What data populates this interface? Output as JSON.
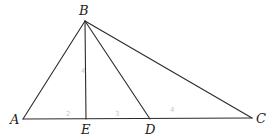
{
  "diagram": {
    "type": "geometry-triangle",
    "points": {
      "A": {
        "label": "A",
        "x": 23,
        "y": 119,
        "label_x": 10,
        "label_y": 124
      },
      "B": {
        "label": "B",
        "x": 85,
        "y": 21,
        "label_x": 79,
        "label_y": 15
      },
      "C": {
        "label": "C",
        "x": 252,
        "y": 118,
        "label_x": 256,
        "label_y": 123
      },
      "D": {
        "label": "D",
        "x": 150,
        "y": 119,
        "label_x": 145,
        "label_y": 134
      },
      "E": {
        "label": "E",
        "x": 86,
        "y": 119,
        "label_x": 81,
        "label_y": 134
      }
    },
    "segments": [
      {
        "from": "A",
        "to": "B"
      },
      {
        "from": "B",
        "to": "C"
      },
      {
        "from": "A",
        "to": "C"
      },
      {
        "from": "B",
        "to": "E"
      },
      {
        "from": "B",
        "to": "D"
      }
    ],
    "annotations": [
      {
        "text": "2",
        "x": 66,
        "y": 116,
        "near": "AE"
      },
      {
        "text": "3",
        "x": 115,
        "y": 116,
        "near": "ED"
      },
      {
        "text": "4",
        "x": 170,
        "y": 112,
        "near": "DC"
      },
      {
        "text": "4",
        "x": 81,
        "y": 73,
        "near": "BE"
      }
    ]
  }
}
